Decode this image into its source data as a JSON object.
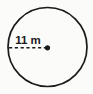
{
  "figure": {
    "type": "geometry-diagram",
    "shape": "circle",
    "background_color": "#fbfbfa",
    "stroke_color": "#1a1a1a",
    "circle": {
      "center_x": 47.5,
      "center_y": 47,
      "radius": 39.5,
      "stroke_width": 1.7,
      "fill": "none"
    },
    "center_dot": {
      "cx": 47.5,
      "cy": 47.8,
      "r": 2.6,
      "fill": "#1a1a1a"
    },
    "radius_segment": {
      "x1": 9,
      "y1": 47.8,
      "x2": 46,
      "y2": 47.8,
      "stroke_width": 1.6,
      "dash_pattern": "3.2 2.6"
    },
    "label": {
      "text": "11 m",
      "value": 11,
      "unit": "m",
      "measures": "radius",
      "x": 28,
      "y": 43.5,
      "anchor": "middle"
    }
  }
}
